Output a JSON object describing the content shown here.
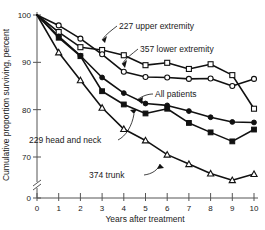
{
  "chart_data": {
    "type": "line",
    "title": "",
    "xlabel": "Years after treatment",
    "ylabel": "Cumulative proportion surviving, percent",
    "xlim": [
      0,
      10
    ],
    "ylim": [
      65,
      100
    ],
    "xticks": [
      0,
      1,
      2,
      3,
      4,
      5,
      6,
      7,
      8,
      9,
      10
    ],
    "xtick_labels": [
      "0",
      "1",
      "2",
      "3",
      "4",
      "5",
      "6",
      "7",
      "8",
      "9",
      "10"
    ],
    "yticks": [
      70,
      80,
      90,
      100
    ],
    "ytick_labels": [
      "70",
      "80",
      "90",
      "100"
    ],
    "y_axis_break": true,
    "y_origin_label": "0",
    "grid": false,
    "legend": "inline-annotations",
    "x": [
      0,
      1,
      2,
      3,
      4,
      5,
      6,
      7,
      8,
      9,
      10
    ],
    "series": [
      {
        "name": "227 upper extremity",
        "label": "227 upper extremity",
        "marker": "open-square",
        "count": 227,
        "values": [
          100.0,
          96.4,
          93.2,
          92.6,
          91.5,
          89.4,
          89.9,
          88.6,
          89.6,
          87.3,
          80.2
        ]
      },
      {
        "name": "357 lower extremity",
        "label": "357 lower extremity",
        "marker": "open-circle",
        "count": 357,
        "values": [
          100.0,
          97.8,
          95.0,
          91.7,
          88.0,
          86.9,
          86.8,
          86.5,
          86.6,
          85.0,
          86.5
        ]
      },
      {
        "name": "All patients",
        "label": "All patients",
        "marker": "filled-circle",
        "count": null,
        "values": [
          100.0,
          95.5,
          91.4,
          86.8,
          83.5,
          81.3,
          80.9,
          79.7,
          78.4,
          77.4,
          77.3
        ]
      },
      {
        "name": "229 head and neck",
        "label": "229 head and neck",
        "marker": "filled-square",
        "count": 229,
        "values": [
          100.0,
          95.2,
          91.3,
          83.9,
          81.1,
          79.2,
          80.2,
          77.2,
          75.2,
          73.3,
          75.8
        ]
      },
      {
        "name": "374 trunk",
        "label": "374 trunk",
        "marker": "open-triangle",
        "count": 374,
        "values": [
          100.0,
          92.1,
          86.2,
          80.4,
          75.9,
          73.5,
          70.5,
          68.5,
          66.5,
          65.1,
          66.4
        ]
      }
    ],
    "annotations": [
      {
        "text": "227 upper extremity",
        "x": 4.0,
        "y": 91.5
      },
      {
        "text": "357 lower extremity",
        "x": 4.3,
        "y": 88.0
      },
      {
        "text": "All patients",
        "x": 5.0,
        "y": 83.5
      },
      {
        "text": "229 head and neck",
        "x": 4.5,
        "y": 78.0
      },
      {
        "text": "374 trunk",
        "x": 5.5,
        "y": 73.5
      }
    ],
    "colors": {
      "line": "#111111",
      "axis": "#555555",
      "background": "#ffffff",
      "text": "#1a1a1a"
    }
  }
}
